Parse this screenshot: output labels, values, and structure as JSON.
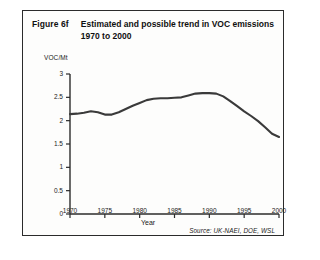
{
  "figure": {
    "number": "Figure 6f",
    "title": "Estimated and possible trend in VOC emissions 1970 to 2000",
    "source": "Source: UK-NAEI, DOE, WSL"
  },
  "chart_data": {
    "type": "line",
    "title": "Estimated and possible trend in VOC emissions 1970 to 2000",
    "xlabel": "Year",
    "ylabel": "VOC/Mt",
    "xlim": [
      1970,
      2000
    ],
    "ylim": [
      0,
      3
    ],
    "grid": false,
    "legend": null,
    "xticks": [
      1970,
      1975,
      1980,
      1985,
      1990,
      1995,
      2000
    ],
    "xtick_labels": [
      "1970",
      "1975",
      "1980",
      "1985",
      "1990",
      "1995",
      "2000"
    ],
    "yticks": [
      0,
      0.5,
      1,
      1.5,
      2,
      2.5,
      3
    ],
    "ytick_labels": [
      "0",
      "0.5",
      "1",
      "1.5",
      "2",
      "2.5",
      "3"
    ],
    "line_color": "#3a3a3a",
    "x": [
      1970,
      1971,
      1972,
      1973,
      1974,
      1975,
      1976,
      1977,
      1978,
      1979,
      1980,
      1981,
      1982,
      1983,
      1984,
      1985,
      1986,
      1987,
      1988,
      1989,
      1990,
      1991,
      1992,
      1993,
      1994,
      1995,
      1996,
      1997,
      1998,
      1999,
      2000
    ],
    "values": [
      2.14,
      2.15,
      2.17,
      2.2,
      2.18,
      2.13,
      2.13,
      2.18,
      2.25,
      2.32,
      2.38,
      2.44,
      2.47,
      2.48,
      2.48,
      2.49,
      2.5,
      2.54,
      2.58,
      2.59,
      2.59,
      2.58,
      2.52,
      2.42,
      2.31,
      2.2,
      2.1,
      1.99,
      1.86,
      1.72,
      1.65
    ],
    "series_name": "VOC emissions"
  }
}
